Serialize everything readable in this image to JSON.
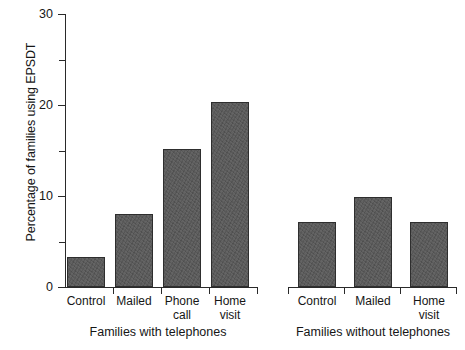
{
  "chart_data": {
    "type": "bar",
    "title": "",
    "xlabel": "",
    "ylabel": "Percentage of families using EPSDT",
    "ylim": [
      0,
      30
    ],
    "grid": false,
    "legend": "none",
    "y_ticks_major": [
      "0",
      "10",
      "20",
      "30"
    ],
    "y_ticks_major_values": [
      0,
      10,
      20,
      30
    ],
    "y_ticks_minor_values": [
      5,
      15,
      25
    ],
    "groups": [
      {
        "name": "Families with telephones",
        "categories": [
          "Control",
          "Mailed",
          "Phone\ncall",
          "Home\nvisit"
        ],
        "values": [
          3.3,
          8.0,
          15.2,
          20.3
        ]
      },
      {
        "name": "Families without telephones",
        "categories": [
          "Control",
          "Mailed",
          "Home\nvisit"
        ],
        "values": [
          7.1,
          9.9,
          7.1
        ]
      }
    ],
    "categories": [
      "Control",
      "Mailed",
      "Phone call",
      "Home visit",
      "Control",
      "Mailed",
      "Home visit"
    ],
    "values": [
      3.3,
      8.0,
      15.2,
      20.3,
      7.1,
      9.9,
      7.1
    ],
    "bar_color": "#585858",
    "axis_color": "#2a2a2a",
    "background_color": "#ffffff"
  },
  "axis": {
    "y_label": "Percentage of families using EPSDT",
    "tick_0": "0",
    "tick_10": "10",
    "tick_20": "20",
    "tick_30": "30"
  },
  "bars": [
    {
      "label": "Control",
      "value": 3.3,
      "group": "with"
    },
    {
      "label": "Mailed",
      "value": 8.0,
      "group": "with"
    },
    {
      "label": "Phone\ncall",
      "value": 15.2,
      "group": "with"
    },
    {
      "label": "Home\nvisit",
      "value": 20.3,
      "group": "with"
    },
    {
      "label": "Control",
      "value": 7.1,
      "group": "without"
    },
    {
      "label": "Mailed",
      "value": 9.9,
      "group": "without"
    },
    {
      "label": "Home\nvisit",
      "value": 7.1,
      "group": "without"
    }
  ],
  "group_labels": {
    "left": "Families with telephones",
    "right": "Families without telephones"
  }
}
